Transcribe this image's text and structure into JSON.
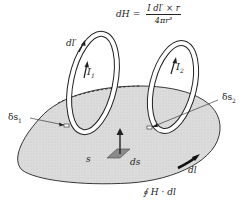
{
  "figure": {
    "type": "physics-diagram",
    "formula": {
      "lhs": "dH",
      "equals": "=",
      "numerator": "I dl′ × r",
      "denominator": "4πr³"
    },
    "labels": {
      "dl_prime": "dl′",
      "current_1": "I",
      "current_1_sub": "1",
      "current_2": "I",
      "current_2_sub": "2",
      "delta_s1": "δs",
      "delta_s1_sub": "1",
      "delta_s2": "δs",
      "delta_s2_sub": "2",
      "surface": "s",
      "surface_element": "ds",
      "boundary_element": "dl",
      "line_integral": "∮ H · dl"
    },
    "colors": {
      "surface_fill": "#d9d9d9",
      "ink": "#222222",
      "ds_patch": "#8a8a8a",
      "background": "#ffffff"
    }
  }
}
